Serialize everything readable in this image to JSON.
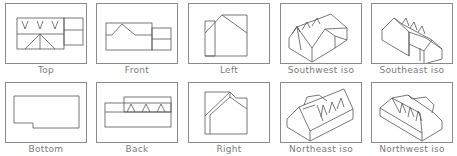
{
  "rows": [
    {
      "panels": [
        {
          "id": "top",
          "label": "Top"
        },
        {
          "id": "front",
          "label": "Front"
        },
        {
          "id": "left",
          "label": "Left"
        },
        {
          "id": "southwest-iso",
          "label": "Southwest iso"
        },
        {
          "id": "southeast-iso",
          "label": "Southeast iso"
        }
      ]
    },
    {
      "panels": [
        {
          "id": "bottom",
          "label": "Bottom"
        },
        {
          "id": "back",
          "label": "Back"
        },
        {
          "id": "right",
          "label": "Right"
        },
        {
          "id": "northeast-iso",
          "label": "Northeast iso"
        },
        {
          "id": "northwest-iso",
          "label": "Northwest iso"
        }
      ]
    }
  ],
  "colors": {
    "frame": "#8a8a8a",
    "line": "#555555",
    "label": "#7a7a7a",
    "background": "#ffffff"
  }
}
